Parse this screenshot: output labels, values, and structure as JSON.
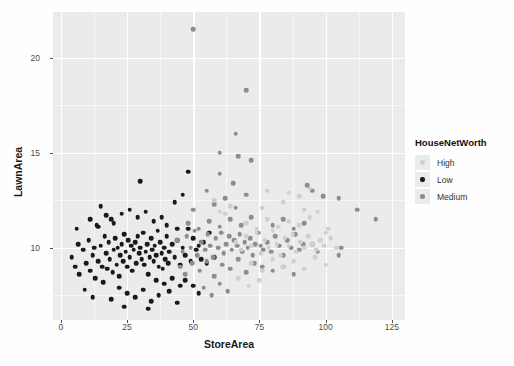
{
  "chart_data": {
    "type": "scatter",
    "title": "",
    "xlabel": "StoreArea",
    "ylabel": "LawnArea",
    "xlim": [
      -3,
      130
    ],
    "ylim": [
      6.2,
      22.4
    ],
    "xticks": [
      0,
      25,
      50,
      75,
      100,
      125
    ],
    "yticks": [
      10,
      15,
      20
    ],
    "grid": true,
    "legend": {
      "title": "HouseNetWorth",
      "position": "right",
      "entries": [
        {
          "label": "High",
          "color": "#cfcfcf"
        },
        {
          "label": "Low",
          "color": "#1a1a1a"
        },
        {
          "label": "Medium",
          "color": "#8d8d8d"
        }
      ]
    },
    "series": [
      {
        "name": "Low",
        "color": "#1a1a1a",
        "points": [
          [
            4.0,
            9.5
          ],
          [
            5.5,
            9.0
          ],
          [
            6.5,
            10.2
          ],
          [
            7.0,
            8.6
          ],
          [
            8.5,
            9.9
          ],
          [
            9.5,
            9.2
          ],
          [
            10.5,
            10.4
          ],
          [
            11.0,
            8.8
          ],
          [
            12.0,
            9.6
          ],
          [
            12.5,
            10.0
          ],
          [
            13.0,
            8.4
          ],
          [
            13.5,
            11.2
          ],
          [
            14.0,
            9.3
          ],
          [
            15.0,
            10.1
          ],
          [
            15.5,
            9.0
          ],
          [
            16.0,
            8.2
          ],
          [
            16.5,
            10.6
          ],
          [
            17.0,
            9.7
          ],
          [
            17.5,
            8.9
          ],
          [
            18.0,
            10.3
          ],
          [
            18.5,
            9.4
          ],
          [
            19.0,
            11.5
          ],
          [
            19.5,
            8.7
          ],
          [
            20.0,
            9.9
          ],
          [
            20.5,
            10.5
          ],
          [
            21.0,
            9.1
          ],
          [
            21.5,
            10.0
          ],
          [
            22.0,
            8.5
          ],
          [
            22.5,
            9.6
          ],
          [
            23.0,
            10.2
          ],
          [
            23.5,
            9.3
          ],
          [
            24.0,
            10.7
          ],
          [
            24.5,
            9.8
          ],
          [
            25.0,
            9.0
          ],
          [
            25.5,
            10.4
          ],
          [
            26.0,
            9.5
          ],
          [
            26.5,
            10.1
          ],
          [
            27.0,
            8.8
          ],
          [
            27.5,
            9.9
          ],
          [
            28.0,
            10.3
          ],
          [
            28.5,
            9.2
          ],
          [
            29.0,
            10.6
          ],
          [
            29.5,
            9.7
          ],
          [
            30.0,
            10.0
          ],
          [
            30.5,
            9.4
          ],
          [
            31.0,
            10.8
          ],
          [
            31.5,
            9.1
          ],
          [
            32.0,
            9.8
          ],
          [
            32.5,
            10.2
          ],
          [
            33.0,
            8.6
          ],
          [
            33.5,
            9.5
          ],
          [
            34.0,
            10.5
          ],
          [
            34.5,
            9.9
          ],
          [
            35.0,
            9.3
          ],
          [
            35.5,
            10.1
          ],
          [
            36.0,
            9.6
          ],
          [
            36.5,
            10.9
          ],
          [
            37.0,
            9.0
          ],
          [
            37.5,
            10.3
          ],
          [
            38.0,
            9.7
          ],
          [
            38.5,
            8.9
          ],
          [
            39.0,
            10.0
          ],
          [
            39.5,
            9.4
          ],
          [
            40.0,
            10.6
          ],
          [
            40.5,
            9.2
          ],
          [
            41.0,
            9.8
          ],
          [
            42.0,
            10.2
          ],
          [
            43.0,
            9.5
          ],
          [
            44.0,
            10.4
          ],
          [
            45.0,
            9.1
          ],
          [
            46.0,
            10.0
          ],
          [
            47.0,
            9.6
          ],
          [
            48.0,
            11.0
          ],
          [
            49.0,
            9.3
          ],
          [
            50.0,
            10.5
          ],
          [
            51.0,
            9.9
          ],
          [
            52.0,
            10.1
          ],
          [
            53.0,
            9.4
          ],
          [
            54.0,
            10.3
          ],
          [
            23.0,
            11.8
          ],
          [
            26.0,
            12.0
          ],
          [
            29.0,
            11.6
          ],
          [
            32.0,
            11.9
          ],
          [
            35.0,
            11.4
          ],
          [
            20.0,
            11.3
          ],
          [
            17.0,
            11.7
          ],
          [
            14.0,
            11.1
          ],
          [
            11.0,
            11.5
          ],
          [
            25.0,
            7.6
          ],
          [
            28.0,
            7.4
          ],
          [
            31.0,
            7.8
          ],
          [
            34.0,
            7.2
          ],
          [
            37.0,
            7.5
          ],
          [
            22.0,
            7.9
          ],
          [
            19.0,
            7.3
          ],
          [
            41.0,
            7.7
          ],
          [
            44.0,
            7.1
          ],
          [
            30.0,
            13.5
          ],
          [
            48.0,
            14.0
          ],
          [
            43.0,
            12.4
          ],
          [
            46.0,
            12.8
          ],
          [
            6.0,
            11.0
          ],
          [
            9.0,
            7.8
          ],
          [
            12.0,
            7.4
          ],
          [
            15.0,
            12.2
          ],
          [
            50.0,
            8.0
          ],
          [
            52.0,
            7.6
          ],
          [
            55.0,
            9.2
          ],
          [
            56.0,
            10.8
          ],
          [
            58.0,
            9.5
          ],
          [
            47.0,
            8.3
          ],
          [
            45.0,
            8.0
          ],
          [
            42.0,
            8.4
          ],
          [
            39.0,
            8.1
          ],
          [
            36.0,
            8.3
          ],
          [
            24.0,
            6.9
          ],
          [
            33.0,
            6.8
          ],
          [
            40.0,
            11.2
          ],
          [
            38.0,
            11.6
          ],
          [
            44.0,
            11.0
          ]
        ]
      },
      {
        "name": "Medium",
        "color": "#8d8d8d",
        "points": [
          [
            44.0,
            10.4
          ],
          [
            46.0,
            9.8
          ],
          [
            47.5,
            10.6
          ],
          [
            49.0,
            10.0
          ],
          [
            50.5,
            10.9
          ],
          [
            51.5,
            9.6
          ],
          [
            53.0,
            10.3
          ],
          [
            54.5,
            9.9
          ],
          [
            55.5,
            10.7
          ],
          [
            56.5,
            10.1
          ],
          [
            57.5,
            9.5
          ],
          [
            58.5,
            10.5
          ],
          [
            59.5,
            10.0
          ],
          [
            60.5,
            10.8
          ],
          [
            61.5,
            9.7
          ],
          [
            62.5,
            10.2
          ],
          [
            63.5,
            10.6
          ],
          [
            64.5,
            9.9
          ],
          [
            65.5,
            10.4
          ],
          [
            66.5,
            10.1
          ],
          [
            67.5,
            10.7
          ],
          [
            68.5,
            9.8
          ],
          [
            69.5,
            10.3
          ],
          [
            70.5,
            10.0
          ],
          [
            71.5,
            10.5
          ],
          [
            72.5,
            9.6
          ],
          [
            73.5,
            10.2
          ],
          [
            74.5,
            10.8
          ],
          [
            75.5,
            10.1
          ],
          [
            76.5,
            9.9
          ],
          [
            48.0,
            11.3
          ],
          [
            52.0,
            11.0
          ],
          [
            56.0,
            11.4
          ],
          [
            60.0,
            11.1
          ],
          [
            64.0,
            11.5
          ],
          [
            68.0,
            11.2
          ],
          [
            72.0,
            11.6
          ],
          [
            50.0,
            12.0
          ],
          [
            58.0,
            12.3
          ],
          [
            66.0,
            12.1
          ],
          [
            62.0,
            12.6
          ],
          [
            55.0,
            13.0
          ],
          [
            65.0,
            13.4
          ],
          [
            70.0,
            12.8
          ],
          [
            60.0,
            13.9
          ],
          [
            67.0,
            14.8
          ],
          [
            72.0,
            14.6
          ],
          [
            60.0,
            15.0
          ],
          [
            66.0,
            16.0
          ],
          [
            70.0,
            18.3
          ],
          [
            50.0,
            21.5
          ],
          [
            45.0,
            9.0
          ],
          [
            47.0,
            8.6
          ],
          [
            49.5,
            9.2
          ],
          [
            52.5,
            8.8
          ],
          [
            55.0,
            9.3
          ],
          [
            58.0,
            8.5
          ],
          [
            61.0,
            9.1
          ],
          [
            64.0,
            8.9
          ],
          [
            67.0,
            9.4
          ],
          [
            70.0,
            8.7
          ],
          [
            73.0,
            9.2
          ],
          [
            76.0,
            9.0
          ],
          [
            54.0,
            7.9
          ],
          [
            57.0,
            7.5
          ],
          [
            60.0,
            8.1
          ],
          [
            63.0,
            7.7
          ],
          [
            78.0,
            10.3
          ],
          [
            79.5,
            9.8
          ],
          [
            81.0,
            10.6
          ],
          [
            82.5,
            10.1
          ],
          [
            84.0,
            9.6
          ],
          [
            85.5,
            10.4
          ],
          [
            87.0,
            10.0
          ],
          [
            88.5,
            10.7
          ],
          [
            90.0,
            9.9
          ],
          [
            91.5,
            10.2
          ],
          [
            80.0,
            11.2
          ],
          [
            84.0,
            11.5
          ],
          [
            88.0,
            11.0
          ],
          [
            92.0,
            11.3
          ],
          [
            95.0,
            10.2
          ],
          [
            97.0,
            9.8
          ],
          [
            80.0,
            8.8
          ],
          [
            84.0,
            9.0
          ],
          [
            88.0,
            8.6
          ],
          [
            105.0,
            12.6
          ],
          [
            112.0,
            12.0
          ],
          [
            119.0,
            11.5
          ],
          [
            106.0,
            10.0
          ],
          [
            105.0,
            9.6
          ],
          [
            95.0,
            13.0
          ],
          [
            99.0,
            12.7
          ],
          [
            93.0,
            13.3
          ]
        ]
      },
      {
        "name": "High",
        "color": "#cfcfcf",
        "points": [
          [
            66.0,
            10.3
          ],
          [
            68.0,
            9.9
          ],
          [
            70.0,
            10.6
          ],
          [
            72.0,
            10.1
          ],
          [
            74.0,
            10.8
          ],
          [
            75.5,
            9.7
          ],
          [
            77.0,
            10.4
          ],
          [
            78.5,
            10.0
          ],
          [
            80.0,
            10.9
          ],
          [
            81.5,
            10.2
          ],
          [
            83.0,
            9.6
          ],
          [
            84.5,
            10.5
          ],
          [
            86.0,
            10.1
          ],
          [
            87.5,
            10.7
          ],
          [
            89.0,
            9.8
          ],
          [
            90.5,
            10.3
          ],
          [
            92.0,
            10.0
          ],
          [
            93.5,
            10.6
          ],
          [
            95.0,
            10.2
          ],
          [
            96.5,
            9.9
          ],
          [
            98.0,
            10.4
          ],
          [
            99.5,
            10.1
          ],
          [
            70.0,
            11.3
          ],
          [
            74.0,
            11.0
          ],
          [
            78.0,
            11.5
          ],
          [
            82.0,
            11.1
          ],
          [
            86.0,
            11.4
          ],
          [
            90.0,
            11.2
          ],
          [
            94.0,
            11.6
          ],
          [
            76.0,
            12.1
          ],
          [
            84.0,
            12.4
          ],
          [
            92.0,
            12.0
          ],
          [
            72.0,
            9.2
          ],
          [
            76.0,
            8.8
          ],
          [
            80.0,
            9.4
          ],
          [
            84.0,
            9.0
          ],
          [
            88.0,
            9.3
          ],
          [
            92.0,
            8.9
          ],
          [
            96.0,
            9.5
          ],
          [
            100.0,
            9.1
          ],
          [
            102.0,
            10.5
          ],
          [
            104.0,
            10.0
          ],
          [
            101.0,
            11.0
          ],
          [
            78.0,
            13.0
          ],
          [
            86.0,
            12.9
          ],
          [
            64.0,
            12.2
          ],
          [
            62.0,
            11.8
          ],
          [
            67.0,
            8.4
          ],
          [
            71.0,
            8.0
          ],
          [
            75.0,
            8.3
          ],
          [
            60.0,
            11.9
          ],
          [
            58.0,
            12.5
          ],
          [
            90.0,
            12.7
          ],
          [
            94.0,
            13.1
          ],
          [
            100.0,
            10.8
          ],
          [
            97.0,
            11.9
          ]
        ]
      }
    ]
  }
}
